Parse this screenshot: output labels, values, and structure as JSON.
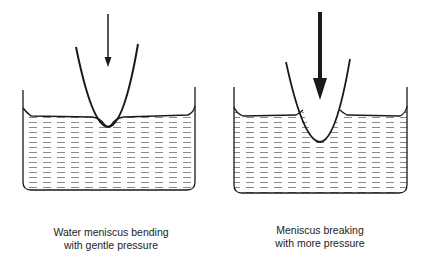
{
  "panels": [
    {
      "id": "gentle",
      "caption": {
        "line1": "Water meniscus bending",
        "line2": "with gentle pressure"
      },
      "arrow": {
        "weight": "thin",
        "meaning": "gentle pressure"
      }
    },
    {
      "id": "more",
      "caption": {
        "line1": "Meniscus breaking",
        "line2": "with more pressure"
      },
      "arrow": {
        "weight": "thick",
        "meaning": "more pressure"
      }
    }
  ],
  "colors": {
    "line": "#1a1a1a",
    "water_dash": "#8a8a8a",
    "background": "#ffffff"
  }
}
